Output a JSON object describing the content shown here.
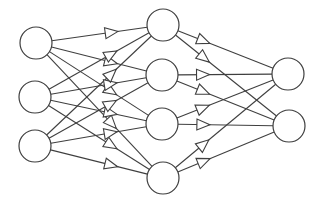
{
  "diagram": {
    "type": "feedforward-neural-network",
    "style": {
      "line_color": "#3f3f3f",
      "node_fill": "#ffffff",
      "background": "#ffffff",
      "arrowhead": "hollow-triangle"
    },
    "layers": [
      {
        "name": "input",
        "nodes": [
          {
            "id": "I1",
            "cx": 36,
            "cy": 43,
            "r": 16
          },
          {
            "id": "I2",
            "cx": 35,
            "cy": 97,
            "r": 16
          },
          {
            "id": "I3",
            "cx": 35,
            "cy": 146,
            "r": 16
          }
        ],
        "arrow_position": 0.6
      },
      {
        "name": "hidden",
        "nodes": [
          {
            "id": "H1",
            "cx": 163,
            "cy": 25,
            "r": 16
          },
          {
            "id": "H2",
            "cx": 162,
            "cy": 75,
            "r": 16
          },
          {
            "id": "H3",
            "cx": 162,
            "cy": 124,
            "r": 16
          },
          {
            "id": "H4",
            "cx": 163,
            "cy": 178,
            "r": 16
          }
        ],
        "arrow_position": 0.33
      },
      {
        "name": "output",
        "nodes": [
          {
            "id": "O1",
            "cx": 288,
            "cy": 74,
            "r": 16
          },
          {
            "id": "O2",
            "cx": 289,
            "cy": 126,
            "r": 16
          }
        ]
      }
    ],
    "connectivity": "fully-connected"
  }
}
